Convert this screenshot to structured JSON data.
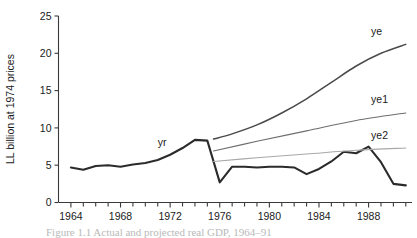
{
  "chart_data": {
    "type": "line",
    "title": "",
    "xlabel": "",
    "ylabel": "LL billion at 1974 prices",
    "xlim": [
      1963,
      1991.5
    ],
    "ylim": [
      0,
      25
    ],
    "grid": false,
    "legend_position": "inline-right-of-each-line",
    "y_ticks": [
      0,
      5,
      10,
      15,
      20,
      25
    ],
    "y_tick_labels": [
      "0",
      "5",
      "10",
      "15",
      "20",
      "25"
    ],
    "x_ticks": [
      1964,
      1968,
      1972,
      1976,
      1980,
      1984,
      1988
    ],
    "x_tick_labels": [
      "1964",
      "1968",
      "1972",
      "1976",
      "1980",
      "1984",
      "1988"
    ],
    "x_minor_tick_interval": 1,
    "series": [
      {
        "name": "yr",
        "label": "yr",
        "style": "thick-dark",
        "color": "#2b2b2b",
        "label_x": 1971.0,
        "label_y": 7.6,
        "x": [
          1964,
          1965,
          1966,
          1967,
          1968,
          1969,
          1970,
          1971,
          1972,
          1973,
          1974,
          1975,
          1976,
          1977,
          1978,
          1979,
          1980,
          1981,
          1982,
          1983,
          1984,
          1985,
          1986,
          1987,
          1988,
          1989,
          1990,
          1991
        ],
        "values": [
          4.7,
          4.4,
          4.9,
          5.0,
          4.8,
          5.1,
          5.3,
          5.7,
          6.4,
          7.3,
          8.4,
          8.3,
          2.7,
          4.8,
          4.8,
          4.7,
          4.8,
          4.8,
          4.7,
          3.8,
          4.5,
          5.5,
          6.8,
          6.6,
          7.5,
          5.4,
          2.5,
          2.3
        ]
      },
      {
        "name": "ye",
        "label": "ye",
        "style": "medium-dark",
        "color": "#4a4a4a",
        "label_x": 1988.2,
        "label_y": 22.4,
        "x": [
          1975.5,
          1977,
          1979,
          1981,
          1983,
          1985,
          1987,
          1989,
          1991
        ],
        "values": [
          8.5,
          9.2,
          10.4,
          12.0,
          13.9,
          16.1,
          18.3,
          20.0,
          21.2
        ]
      },
      {
        "name": "ye1",
        "label": "ye1",
        "style": "thin-gray",
        "color": "#6e6e6e",
        "label_x": 1988.2,
        "label_y": 13.3,
        "x": [
          1975.5,
          1979,
          1983,
          1987,
          1991
        ],
        "values": [
          6.9,
          8.2,
          9.6,
          11.0,
          12.0
        ]
      },
      {
        "name": "ye2",
        "label": "ye2",
        "style": "thin-light-gray",
        "color": "#a8a8a8",
        "label_x": 1988.2,
        "label_y": 8.5,
        "x": [
          1975.5,
          1979,
          1983,
          1987,
          1991
        ],
        "values": [
          5.5,
          6.0,
          6.5,
          7.0,
          7.3
        ]
      }
    ]
  },
  "caption": {
    "text": "Figure 1.1 Actual and projected real GDP, 1964–91"
  }
}
